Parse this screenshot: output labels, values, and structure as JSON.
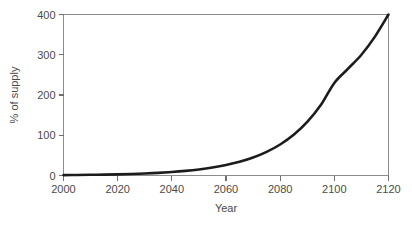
{
  "chart_data": {
    "type": "line",
    "title": "",
    "xlabel": "Year",
    "ylabel": "% of supply",
    "xlim": [
      2000,
      2120
    ],
    "ylim": [
      0,
      400
    ],
    "grid": false,
    "legend": null,
    "xticks": [
      2000,
      2020,
      2040,
      2060,
      2080,
      2100,
      2120
    ],
    "yticks": [
      0,
      100,
      200,
      300,
      400
    ],
    "xtick_labels": [
      "2000",
      "2020",
      "2040",
      "2060",
      "2080",
      "2100",
      "2120"
    ],
    "ytick_labels": [
      "0",
      "100",
      "200",
      "300",
      "400"
    ],
    "series": [
      {
        "name": "% of supply",
        "color": "#1c1c1c",
        "x": [
          2000,
          2005,
          2010,
          2015,
          2020,
          2025,
          2030,
          2035,
          2040,
          2045,
          2050,
          2055,
          2060,
          2065,
          2070,
          2075,
          2080,
          2085,
          2090,
          2095,
          2100,
          2105,
          2110,
          2115,
          2120
        ],
        "values": [
          1,
          1.3,
          1.7,
          2.2,
          2.9,
          3.8,
          5,
          6.6,
          8.7,
          11.4,
          15,
          19.7,
          25.9,
          34,
          44.7,
          58.7,
          77,
          101,
          133,
          175,
          230,
          265,
          300,
          345,
          400
        ]
      }
    ]
  },
  "axes": {
    "x_axis_name": "Year",
    "y_axis_name": "% of supply"
  },
  "colors": {
    "series": "#1c1c1c",
    "frame": "#8c8c8c",
    "text": "#4a4a4a",
    "background": "#ffffff"
  }
}
